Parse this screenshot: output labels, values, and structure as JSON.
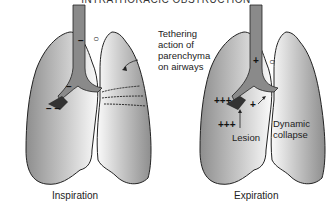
{
  "title": "INTRATHORACIC OBSTRUCTION",
  "left_panel": {
    "caption": "Inspiration",
    "trachea_sign": "−",
    "pleural_sign": "−",
    "airway_sign": "−",
    "lesion_sign": "− −",
    "reference_symbol": "○",
    "annotation": [
      "Tethering",
      "action of",
      "parenchyma",
      "on airways"
    ]
  },
  "right_panel": {
    "caption": "Expiration",
    "trachea_sign": "+",
    "pleural_sign": "+++",
    "airway_sign": "+",
    "lesion_sign": "+++",
    "reference_symbol": "○",
    "annotation_lesion": "Lesion",
    "annotation_collapse": [
      "Dynamic",
      "collapse"
    ]
  },
  "colors": {
    "lung_fill_dark": "#9a9a9a",
    "lung_fill_light": "#ffffff",
    "outline": "#222222"
  }
}
